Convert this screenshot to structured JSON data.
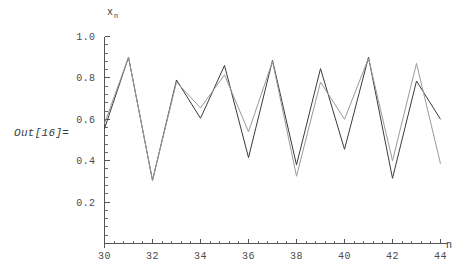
{
  "output_label": "Out[16]=",
  "chart_data": {
    "type": "line",
    "title": "",
    "xlabel": "n",
    "ylabel": "x",
    "ylabel_subscript": "n",
    "x": [
      30,
      31,
      32,
      33,
      34,
      35,
      36,
      37,
      38,
      39,
      40,
      41,
      42,
      43,
      44
    ],
    "xlim": [
      30,
      44
    ],
    "ylim": [
      0.0,
      1.0
    ],
    "grid": false,
    "legend": "none",
    "x_ticks_major": [
      30,
      32,
      34,
      36,
      38,
      40,
      42,
      44
    ],
    "x_tick_labels": [
      "30",
      "32",
      "34",
      "36",
      "38",
      "40",
      "42",
      "44"
    ],
    "x_ticks_minor": [
      31,
      33,
      35,
      37,
      39,
      41,
      43
    ],
    "x_minor_subdivisions": 5,
    "y_ticks_major": [
      0.2,
      0.4,
      0.6,
      0.8,
      1.0
    ],
    "y_tick_labels": [
      "0.2",
      "0.4",
      "0.6",
      "0.8",
      "1.0"
    ],
    "y_minor_subdivisions": 5,
    "series": [
      {
        "name": "trajectory-a",
        "color": "#3a3a3a",
        "values": [
          0.555,
          0.9,
          0.305,
          0.79,
          0.605,
          0.86,
          0.415,
          0.885,
          0.38,
          0.845,
          0.455,
          0.9,
          0.315,
          0.785,
          0.6
        ]
      },
      {
        "name": "trajectory-b",
        "color": "#9a9a9a",
        "values": [
          0.58,
          0.9,
          0.305,
          0.78,
          0.655,
          0.815,
          0.54,
          0.88,
          0.325,
          0.78,
          0.6,
          0.895,
          0.4,
          0.87,
          0.385
        ]
      }
    ]
  }
}
